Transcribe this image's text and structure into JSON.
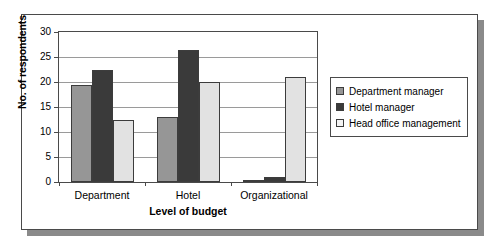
{
  "chart_data": {
    "type": "bar",
    "title": "",
    "xlabel": "Level of budget",
    "ylabel": "No. of respondents",
    "categories": [
      "Department",
      "Hotel",
      "Organizational"
    ],
    "series": [
      {
        "name": "Department manager",
        "values": [
          19.5,
          13,
          0.5
        ],
        "color": "#969696"
      },
      {
        "name": "Hotel manager",
        "values": [
          22.5,
          26.5,
          1
        ],
        "color": "#3a3a3a"
      },
      {
        "name": "Head office management",
        "values": [
          12.5,
          20,
          21
        ],
        "color": "#e2e2e2"
      }
    ],
    "ylim": [
      0,
      30
    ],
    "yticks": [
      0,
      5,
      10,
      15,
      20,
      25,
      30
    ],
    "ytick_labels": [
      "0",
      "5",
      "10",
      "15",
      "20",
      "25",
      "30"
    ],
    "grid": true,
    "legend_position": "right"
  },
  "legend": {
    "items": [
      {
        "label": "Department manager"
      },
      {
        "label": "Hotel manager"
      },
      {
        "label": "Head office management"
      }
    ]
  },
  "axes": {
    "y_title": "No. of respondents",
    "x_title": "Level of budget"
  }
}
